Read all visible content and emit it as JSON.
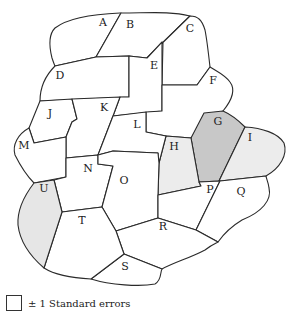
{
  "map": {
    "regions": [
      {
        "id": "A",
        "label": "A",
        "fill": "#ffffff"
      },
      {
        "id": "B",
        "label": "B",
        "fill": "#ffffff"
      },
      {
        "id": "C",
        "label": "C",
        "fill": "#ffffff"
      },
      {
        "id": "D",
        "label": "D",
        "fill": "#ffffff"
      },
      {
        "id": "E",
        "label": "E",
        "fill": "#ffffff"
      },
      {
        "id": "F",
        "label": "F",
        "fill": "#ffffff"
      },
      {
        "id": "G",
        "label": "G",
        "fill": "#c8c8c8"
      },
      {
        "id": "H",
        "label": "H",
        "fill": "#ececec"
      },
      {
        "id": "I",
        "label": "I",
        "fill": "#ececec"
      },
      {
        "id": "J",
        "label": "J",
        "fill": "#ffffff"
      },
      {
        "id": "K",
        "label": "K",
        "fill": "#ffffff"
      },
      {
        "id": "L",
        "label": "L",
        "fill": "#ffffff"
      },
      {
        "id": "M",
        "label": "M",
        "fill": "#ffffff"
      },
      {
        "id": "N",
        "label": "N",
        "fill": "#ffffff"
      },
      {
        "id": "O",
        "label": "O",
        "fill": "#ffffff"
      },
      {
        "id": "P",
        "label": "P",
        "fill": "#ffffff"
      },
      {
        "id": "Q",
        "label": "Q",
        "fill": "#ffffff"
      },
      {
        "id": "R",
        "label": "R",
        "fill": "#ffffff"
      },
      {
        "id": "S",
        "label": "S",
        "fill": "#ffffff"
      },
      {
        "id": "T",
        "label": "T",
        "fill": "#ffffff"
      },
      {
        "id": "U",
        "label": "U",
        "fill": "#e6e6e6"
      }
    ]
  },
  "legend": {
    "label": "± 1 Standard errors",
    "swatch_color": "#ffffff"
  }
}
